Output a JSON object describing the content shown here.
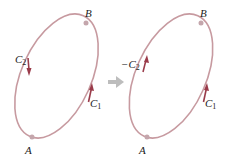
{
  "diagram": {
    "left_panel": {
      "start_point": "A",
      "end_point": "B",
      "curve_left_label": {
        "base": "C",
        "sub": "2",
        "prefix": ""
      },
      "curve_right_label": {
        "base": "C",
        "sub": "1",
        "prefix": ""
      }
    },
    "right_panel": {
      "start_point": "A",
      "end_point": "B",
      "curve_left_label": {
        "base": "C",
        "sub": "2",
        "prefix": "−"
      },
      "curve_right_label": {
        "base": "C",
        "sub": "1",
        "prefix": ""
      }
    },
    "colors": {
      "curve": "#c79aa0",
      "arrow": "#9a3b4a",
      "point": "#c4a6ac",
      "transition_arrow": "#bdbdbd",
      "text": "#222222"
    }
  }
}
